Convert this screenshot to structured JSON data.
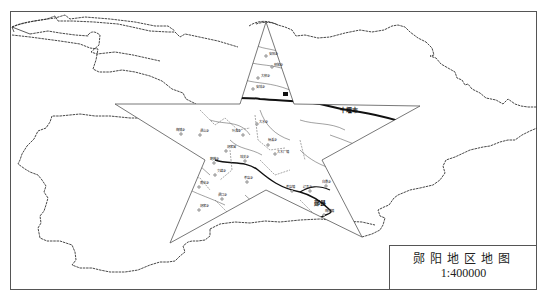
{
  "map": {
    "title": "郧阳地区地图",
    "scale": "1:400000",
    "cities": [
      {
        "name": "十堰市",
        "x": 346,
        "y": 111
      },
      {
        "name": "郧县",
        "x": 318,
        "y": 204
      }
    ],
    "towns": [
      {
        "name": "安阳乡",
        "x": 269,
        "y": 53
      },
      {
        "name": "柳陂乡",
        "x": 274,
        "y": 64
      },
      {
        "name": "大柳乡",
        "x": 262,
        "y": 75
      },
      {
        "name": "安城乡",
        "x": 256,
        "y": 86
      },
      {
        "name": "梅铺乡",
        "x": 182,
        "y": 131
      },
      {
        "name": "谭山乡",
        "x": 200,
        "y": 132
      },
      {
        "name": "大水乡",
        "x": 256,
        "y": 121
      },
      {
        "name": "叶滩乡",
        "x": 243,
        "y": 132
      },
      {
        "name": "杨溪乡",
        "x": 268,
        "y": 142
      },
      {
        "name": "大木厂镇",
        "x": 275,
        "y": 151
      },
      {
        "name": "胡家营",
        "x": 227,
        "y": 148
      },
      {
        "name": "鲍峡乡",
        "x": 215,
        "y": 160
      },
      {
        "name": "城关乡",
        "x": 245,
        "y": 158
      },
      {
        "name": "文峰乡",
        "x": 216,
        "y": 172
      },
      {
        "name": "茶店乡",
        "x": 247,
        "y": 179
      },
      {
        "name": "南化乡",
        "x": 200,
        "y": 184
      },
      {
        "name": "谭口乡",
        "x": 220,
        "y": 196
      },
      {
        "name": "胡家乡",
        "x": 200,
        "y": 207
      },
      {
        "name": "茶店镇",
        "x": 292,
        "y": 188
      },
      {
        "name": "辽瓦乡",
        "x": 310,
        "y": 188
      },
      {
        "name": "白桑乡",
        "x": 326,
        "y": 183
      },
      {
        "name": "梅铺镇",
        "x": 325,
        "y": 212
      }
    ],
    "colors": {
      "line": "#333333",
      "frame": "#555555",
      "background": "#ffffff"
    }
  }
}
